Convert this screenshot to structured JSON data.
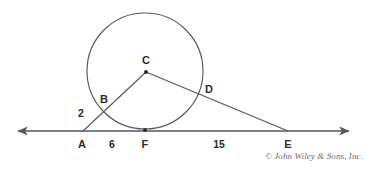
{
  "figure": {
    "background_color": "#ffffff",
    "stroke_color": "#58585a",
    "label_color": "#2b2b2b",
    "credit": "© John Wiley & Sons, Inc."
  },
  "points": [
    {
      "id": "A",
      "label": "A",
      "x": 83,
      "y": 131,
      "label_x": 82,
      "label_y": 144,
      "dot": false
    },
    {
      "id": "B",
      "label": "B",
      "x": 104,
      "y": 112,
      "label_x": 104,
      "label_y": 99,
      "dot": false
    },
    {
      "id": "C",
      "label": "C",
      "x": 146,
      "y": 72,
      "label_x": 146,
      "label_y": 60,
      "dot": true
    },
    {
      "id": "D",
      "label": "D",
      "x": 201,
      "y": 95,
      "label_x": 209,
      "label_y": 89,
      "dot": false
    },
    {
      "id": "E",
      "label": "E",
      "x": 288,
      "y": 131,
      "label_x": 288,
      "label_y": 144,
      "dot": false
    },
    {
      "id": "F",
      "label": "F",
      "x": 145,
      "y": 130,
      "label_x": 145,
      "label_y": 144,
      "dot": true
    }
  ],
  "segment_lengths": [
    {
      "id": "AB",
      "value": "2",
      "x": 81,
      "y": 113
    },
    {
      "id": "AF",
      "value": "6",
      "x": 112,
      "y": 144
    },
    {
      "id": "FE",
      "value": "15",
      "x": 219,
      "y": 144
    }
  ],
  "circle": {
    "center_label": "C",
    "cx": 145,
    "cy": 71,
    "r": 58
  },
  "baseline": {
    "y": 131,
    "x_start": 18,
    "x_end": 349,
    "arrow_left": true,
    "arrow_right": true
  },
  "segments": [
    {
      "id": "CA",
      "from": "C",
      "to": "A"
    },
    {
      "id": "CE",
      "from": "C",
      "to": "E"
    }
  ]
}
